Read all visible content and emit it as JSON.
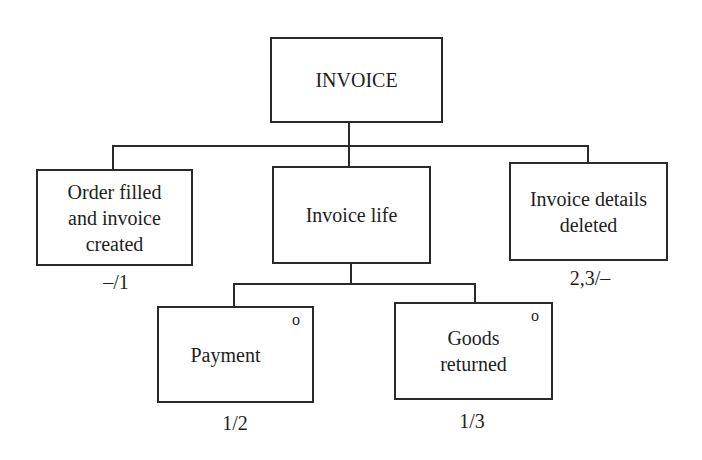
{
  "diagram": {
    "type": "entity-life-history",
    "root": {
      "label": "INVOICE"
    },
    "children": [
      {
        "label": "Order filled and invoice created",
        "label_lines": [
          "Order filled",
          "and invoice",
          "created"
        ],
        "annotation": "–/1"
      },
      {
        "label": "Invoice life",
        "children": [
          {
            "label": "Payment",
            "marker": "o",
            "annotation": "1/2"
          },
          {
            "label": "Goods returned",
            "label_lines": [
              "Goods",
              "returned"
            ],
            "marker": "o",
            "annotation": "1/3"
          }
        ]
      },
      {
        "label": "Invoice details deleted",
        "label_lines": [
          "Invoice details",
          "deleted"
        ],
        "annotation": "2,3/–"
      }
    ]
  }
}
